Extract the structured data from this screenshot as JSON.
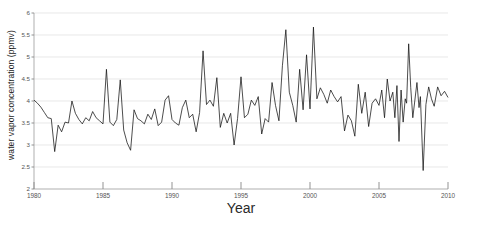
{
  "chart_data": {
    "type": "line",
    "title": "",
    "xlabel": "Year",
    "ylabel": "water vapor concentration (ppmv)",
    "xlim": [
      1980,
      2010
    ],
    "ylim": [
      2,
      6
    ],
    "grid": true,
    "legend": null,
    "xticks": [
      1980,
      1985,
      1990,
      1995,
      2000,
      2005,
      2010
    ],
    "xtick_labels": [
      "1980",
      "1985",
      "1990",
      "1995",
      "2000",
      "2005",
      "2010"
    ],
    "yticks": [
      2,
      2.5,
      3,
      3.5,
      4,
      4.5,
      5,
      5.5,
      6
    ],
    "ytick_labels": [
      "2",
      "2.5",
      "3",
      "3.5",
      "4",
      "4.5",
      "5",
      "5.5",
      "6"
    ],
    "line_color": "#111111",
    "grid_color": "#d9d9d9",
    "series": [
      {
        "name": "water vapor concentration",
        "x": [
          1980.0,
          1980.25,
          1980.5,
          1980.75,
          1981.0,
          1981.25,
          1981.5,
          1981.75,
          1982.0,
          1982.25,
          1982.5,
          1982.75,
          1983.0,
          1983.25,
          1983.5,
          1983.75,
          1984.0,
          1984.25,
          1984.5,
          1984.75,
          1985.0,
          1985.25,
          1985.5,
          1985.75,
          1986.0,
          1986.25,
          1986.5,
          1986.75,
          1987.0,
          1987.25,
          1987.5,
          1987.75,
          1988.0,
          1988.25,
          1988.5,
          1988.75,
          1989.0,
          1989.25,
          1989.5,
          1989.75,
          1990.0,
          1990.25,
          1990.5,
          1990.75,
          1991.0,
          1991.25,
          1991.5,
          1991.75,
          1992.0,
          1992.25,
          1992.5,
          1992.75,
          1993.0,
          1993.25,
          1993.5,
          1993.75,
          1994.0,
          1994.25,
          1994.5,
          1994.75,
          1995.0,
          1995.25,
          1995.5,
          1995.75,
          1996.0,
          1996.25,
          1996.5,
          1996.75,
          1997.0,
          1997.25,
          1997.5,
          1997.75,
          1998.0,
          1998.25,
          1998.5,
          1998.75,
          1999.0,
          1999.25,
          1999.5,
          1999.75,
          2000.0,
          2000.25,
          2000.5,
          2000.75,
          2001.0,
          2001.25,
          2001.5,
          2001.75,
          2002.0,
          2002.25,
          2002.5,
          2002.75,
          2003.0,
          2003.25,
          2003.5,
          2003.75,
          2004.0,
          2004.25,
          2004.5,
          2004.75,
          2005.0,
          2005.2,
          2005.4,
          2005.6,
          2005.8,
          2006.0,
          2006.15,
          2006.3,
          2006.45,
          2006.6,
          2006.75,
          2006.9,
          2007.0,
          2007.15,
          2007.3,
          2007.45,
          2007.6,
          2007.75,
          2007.9,
          2008.0,
          2008.2,
          2008.4,
          2008.6,
          2008.8,
          2009.0,
          2009.25,
          2009.5,
          2009.75,
          2010.0
        ],
        "y": [
          4.02,
          3.95,
          3.86,
          3.74,
          3.62,
          3.6,
          2.85,
          3.45,
          3.3,
          3.52,
          3.5,
          4.0,
          3.72,
          3.58,
          3.48,
          3.62,
          3.55,
          3.76,
          3.62,
          3.55,
          3.48,
          4.72,
          3.52,
          3.44,
          3.58,
          4.48,
          3.34,
          3.05,
          2.88,
          3.8,
          3.6,
          3.55,
          3.48,
          3.7,
          3.58,
          3.82,
          3.44,
          3.52,
          4.02,
          4.12,
          3.58,
          3.5,
          3.45,
          3.85,
          4.02,
          3.62,
          3.7,
          3.3,
          3.74,
          5.14,
          3.92,
          4.02,
          3.88,
          4.53,
          3.4,
          3.72,
          3.5,
          3.72,
          3.0,
          3.6,
          4.55,
          3.62,
          3.7,
          4.02,
          3.9,
          4.1,
          3.25,
          3.6,
          3.52,
          4.42,
          3.9,
          3.55,
          4.8,
          5.62,
          4.2,
          3.9,
          3.52,
          4.72,
          3.8,
          5.05,
          3.82,
          5.68,
          4.05,
          4.3,
          4.15,
          3.95,
          4.25,
          4.1,
          3.98,
          4.1,
          3.32,
          3.68,
          3.55,
          3.2,
          4.38,
          3.72,
          4.2,
          3.42,
          3.95,
          4.05,
          3.9,
          4.25,
          3.62,
          4.5,
          4.0,
          4.2,
          3.62,
          4.35,
          3.08,
          4.25,
          3.52,
          4.05,
          3.95,
          5.3,
          4.3,
          3.62,
          4.02,
          4.42,
          3.85,
          4.1,
          2.42,
          3.92,
          4.32,
          4.05,
          3.88,
          4.32,
          4.12,
          4.22,
          4.08
        ]
      }
    ]
  }
}
